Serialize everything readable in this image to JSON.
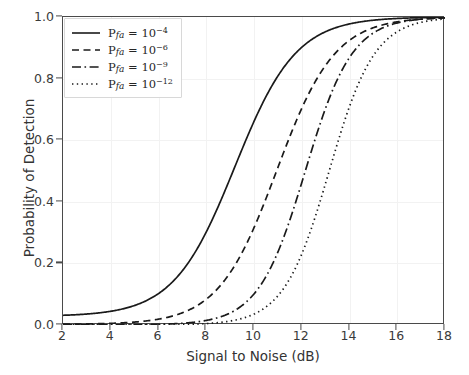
{
  "chart_data": {
    "type": "line",
    "title": "",
    "xlabel": "Signal to Noise (dB)",
    "ylabel": "Probability of Detection",
    "xlim": [
      2,
      18
    ],
    "ylim": [
      0.0,
      1.0
    ],
    "xticks": [
      2,
      4,
      6,
      8,
      10,
      12,
      14,
      16,
      18
    ],
    "yticks": [
      "0.0",
      "0.2",
      "0.4",
      "0.6",
      "0.8",
      "1.0"
    ],
    "grid": true,
    "grid_color": "#f2f2f2",
    "legend_position": "upper left",
    "line_color": "#1a1a1a",
    "series": [
      {
        "name": "P_fa_1e-4",
        "legend_base": "P",
        "legend_sub": "fa",
        "legend_eq": " = 10",
        "legend_exp": "−4",
        "linestyle": "solid",
        "midpoint_db": 9.2,
        "slope": 0.78,
        "floor": 0.028,
        "x": [
          2,
          2.5,
          3,
          3.5,
          4,
          4.5,
          5,
          5.5,
          6,
          6.5,
          7,
          7.5,
          8,
          8.5,
          9,
          9.5,
          10,
          10.5,
          11,
          11.5,
          12,
          12.5,
          13,
          13.5,
          14,
          14.5,
          15,
          15.5,
          16,
          16.5,
          17,
          17.5,
          18
        ],
        "y": [
          0.028,
          0.033,
          0.04,
          0.049,
          0.06,
          0.074,
          0.092,
          0.115,
          0.145,
          0.184,
          0.234,
          0.297,
          0.372,
          0.456,
          0.545,
          0.635,
          0.717,
          0.79,
          0.85,
          0.897,
          0.932,
          0.957,
          0.974,
          0.985,
          0.991,
          0.995,
          0.998,
          0.999,
          1.0,
          1.0,
          1.0,
          1.0,
          1.0
        ]
      },
      {
        "name": "P_fa_1e-6",
        "legend_base": "P",
        "legend_sub": "fa",
        "legend_eq": " = 10",
        "legend_exp": "−6",
        "linestyle": "dashed",
        "midpoint_db": 10.95,
        "slope": 0.82,
        "floor": 0.002,
        "x": [
          2,
          2.5,
          3,
          3.5,
          4,
          4.5,
          5,
          5.5,
          6,
          6.5,
          7,
          7.5,
          8,
          8.5,
          9,
          9.5,
          10,
          10.5,
          11,
          11.5,
          12,
          12.5,
          13,
          13.5,
          14,
          14.5,
          15,
          15.5,
          16,
          16.5,
          17,
          17.5,
          18
        ],
        "y": [
          0.002,
          0.002,
          0.003,
          0.004,
          0.005,
          0.007,
          0.01,
          0.014,
          0.02,
          0.029,
          0.042,
          0.061,
          0.088,
          0.126,
          0.178,
          0.246,
          0.33,
          0.425,
          0.524,
          0.621,
          0.709,
          0.784,
          0.845,
          0.893,
          0.928,
          0.953,
          0.97,
          0.982,
          0.99,
          0.995,
          0.998,
          0.999,
          1.0
        ]
      },
      {
        "name": "P_fa_1e-9",
        "legend_base": "P",
        "legend_sub": "fa",
        "legend_eq": " = 10",
        "legend_exp": "−9",
        "linestyle": "dashdot",
        "midpoint_db": 12.15,
        "slope": 1.02,
        "floor": 0.0005,
        "x": [
          2,
          2.5,
          3,
          3.5,
          4,
          4.5,
          5,
          5.5,
          6,
          6.5,
          7,
          7.5,
          8,
          8.5,
          9,
          9.5,
          10,
          10.5,
          11,
          11.5,
          12,
          12.5,
          13,
          13.5,
          14,
          14.5,
          15,
          15.5,
          16,
          16.5,
          17,
          17.5,
          18
        ],
        "y": [
          0.0005,
          0.0006,
          0.0007,
          0.0009,
          0.0012,
          0.0016,
          0.0022,
          0.0031,
          0.0045,
          0.0068,
          0.0104,
          0.0162,
          0.0256,
          0.041,
          0.066,
          0.1058,
          0.1665,
          0.253,
          0.365,
          0.492,
          0.618,
          0.729,
          0.817,
          0.882,
          0.926,
          0.955,
          0.973,
          0.984,
          0.991,
          0.995,
          0.9975,
          0.999,
          1.0
        ]
      },
      {
        "name": "P_fa_1e-12",
        "legend_base": "P",
        "legend_sub": "fa",
        "legend_eq": " = 10",
        "legend_exp": "−12",
        "linestyle": "dotted",
        "midpoint_db": 13.15,
        "slope": 1.05,
        "floor": 0.0001,
        "x": [
          2,
          2.5,
          3,
          3.5,
          4,
          4.5,
          5,
          5.5,
          6,
          6.5,
          7,
          7.5,
          8,
          8.5,
          9,
          9.5,
          10,
          10.5,
          11,
          11.5,
          12,
          12.5,
          13,
          13.5,
          14,
          14.5,
          15,
          15.5,
          16,
          16.5,
          17,
          17.5,
          18
        ],
        "y": [
          0.0001,
          0.0001,
          0.0001,
          0.0002,
          0.0002,
          0.0003,
          0.0004,
          0.0006,
          0.0009,
          0.0014,
          0.0022,
          0.0035,
          0.0056,
          0.0092,
          0.0152,
          0.0252,
          0.0416,
          0.068,
          0.109,
          0.17,
          0.257,
          0.369,
          0.496,
          0.622,
          0.733,
          0.821,
          0.886,
          0.931,
          0.96,
          0.978,
          0.989,
          0.995,
          1.0
        ]
      }
    ]
  }
}
